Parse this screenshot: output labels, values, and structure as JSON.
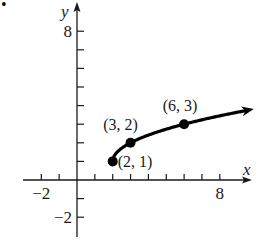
{
  "problem_marker": "•",
  "chart_data": {
    "type": "line",
    "title": "",
    "xlabel": "x",
    "ylabel": "y",
    "xlim": [
      -3,
      10
    ],
    "ylim": [
      -3,
      9
    ],
    "grid": false,
    "function": "y = 1 + sqrt(x - 2)",
    "domain_start": 2,
    "endpoint_closed": true,
    "x_tick_step": 1,
    "y_tick_step": 1,
    "x_tick_labels": [
      {
        "value": -2,
        "label": "−2"
      },
      {
        "value": 8,
        "label": "8"
      }
    ],
    "y_tick_labels": [
      {
        "value": 8,
        "label": "8"
      },
      {
        "value": -2,
        "label": "−2"
      }
    ],
    "x_ticks": [
      -2,
      -1,
      1,
      2,
      3,
      4,
      5,
      6,
      7,
      8
    ],
    "y_ticks": [
      -2,
      -1,
      1,
      2,
      3,
      4,
      5,
      6,
      7,
      8
    ],
    "points": [
      {
        "x": 2,
        "y": 1,
        "label": "(2, 1)"
      },
      {
        "x": 3,
        "y": 2,
        "label": "(3, 2)"
      },
      {
        "x": 6,
        "y": 3,
        "label": "(6, 3)"
      }
    ],
    "curve_end_x": 9.9,
    "colors": {
      "axis": "#1a1a1a",
      "curve": "#000000",
      "text": "#1a1a1a"
    }
  }
}
